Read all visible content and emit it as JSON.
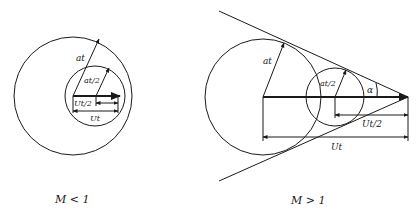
{
  "left_diagram": {
    "caption": "M < 1",
    "labels": {
      "at": "at",
      "at_half": "at/2",
      "Ut_half": "Ut/2",
      "Ut": "Ut"
    }
  },
  "right_diagram": {
    "caption": "M > 1",
    "labels": {
      "at": "at",
      "at_half": "at/2",
      "alpha": "α",
      "Ut_half": "Ut/2",
      "Ut": "Ut"
    }
  },
  "colors": {
    "stroke": "#1a1a1a",
    "background": "#ffffff"
  }
}
